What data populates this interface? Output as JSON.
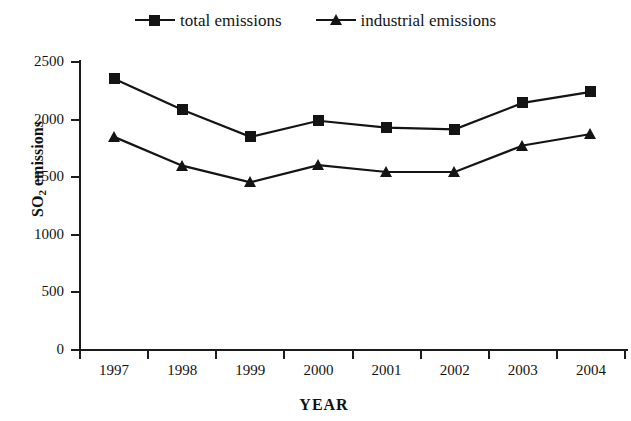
{
  "chart_data": {
    "type": "line",
    "title": "",
    "xlabel": "YEAR",
    "ylabel": "SO2 emissions",
    "ylabel_base": "SO",
    "ylabel_sub": "2",
    "ylabel_rest": " emissions",
    "categories": [
      "1997",
      "1998",
      "1999",
      "2000",
      "2001",
      "2002",
      "2003",
      "2004"
    ],
    "series": [
      {
        "name": "total emissions",
        "marker": "square",
        "color": "#141414",
        "values": [
          2355,
          2085,
          1850,
          1990,
          1930,
          1915,
          2145,
          2240
        ]
      },
      {
        "name": "industrial emissions",
        "marker": "triangle",
        "color": "#141414",
        "values": [
          1850,
          1600,
          1455,
          1605,
          1545,
          1545,
          1775,
          1875
        ]
      }
    ],
    "ylim": [
      0,
      2500
    ],
    "yticks": [
      0,
      500,
      1000,
      1500,
      2000,
      2500
    ],
    "ytick_labels": [
      "0",
      "500",
      "1000",
      "1500",
      "2000",
      "2500"
    ],
    "grid": false,
    "legend_position": "top-center"
  },
  "legend": {
    "entries": [
      {
        "label": "total emissions",
        "marker": "square-marker-icon"
      },
      {
        "label": "industrial emissions",
        "marker": "triangle-marker-icon"
      }
    ]
  },
  "axes": {
    "x_title": "YEAR",
    "y_title_main": "SO",
    "y_title_sub": "2",
    "y_title_tail": " emissions"
  }
}
